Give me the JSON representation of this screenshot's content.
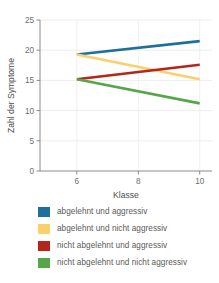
{
  "chart_data": {
    "type": "line",
    "title": "",
    "xlabel": "Klasse",
    "ylabel": "Zahl der Symptome",
    "x": [
      6,
      10
    ],
    "xlim": [
      4.8,
      10.4
    ],
    "ylim": [
      0,
      25
    ],
    "xticks": [
      6,
      8,
      10
    ],
    "xticklabels": [
      "6",
      "8",
      "10"
    ],
    "yticks": [
      0,
      5,
      10,
      15,
      20,
      25
    ],
    "yticklabels": [
      "0",
      "5",
      "10",
      "15",
      "20",
      "25"
    ],
    "grid": "horizontal-and-vertical-light",
    "legend_position": "below",
    "series": [
      {
        "name": "abgelehnt und aggressiv",
        "color": "#1f6f9c",
        "values": [
          19.3,
          21.5
        ]
      },
      {
        "name": "abgelehnt und nicht aggressiv",
        "color": "#fbd06a",
        "values": [
          19.3,
          15.2
        ]
      },
      {
        "name": "nicht abgelehnt und aggressiv",
        "color": "#b5251b",
        "values": [
          15.2,
          17.6
        ]
      },
      {
        "name": "nicht abgelehnt und nicht aggressiv",
        "color": "#57a74a",
        "values": [
          15.2,
          11.2
        ]
      }
    ]
  },
  "legend": {
    "items": [
      {
        "label": "abgelehnt und aggressiv",
        "color": "#1f6f9c"
      },
      {
        "label": "abgelehnt und nicht aggressiv",
        "color": "#fbd06a"
      },
      {
        "label": "nicht abgelehnt und aggressiv",
        "color": "#b5251b"
      },
      {
        "label": "nicht abgelehnt und nicht aggressiv",
        "color": "#57a74a"
      }
    ]
  }
}
